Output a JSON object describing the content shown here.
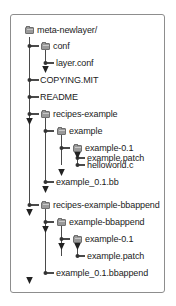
{
  "diagram": {
    "border_color": "#8d8d8d",
    "line_color": "#4a4a4a",
    "folder_color": "#9a9a9a",
    "text_color": "#1b1b1b",
    "nodes": [
      {
        "label": "meta-newlayer/",
        "type": "folder",
        "depth": 0
      },
      {
        "label": "conf",
        "type": "folder",
        "depth": 1
      },
      {
        "label": "layer.conf",
        "type": "file",
        "depth": 2
      },
      {
        "label": "COPYING.MIT",
        "type": "file",
        "depth": 1
      },
      {
        "label": "README",
        "type": "file",
        "depth": 1
      },
      {
        "label": "recipes-example",
        "type": "folder",
        "depth": 1
      },
      {
        "label": "example",
        "type": "folder",
        "depth": 2
      },
      {
        "label": "example-0.1",
        "type": "folder",
        "depth": 3
      },
      {
        "label": "example.patch",
        "type": "file",
        "depth": 4
      },
      {
        "label": "helloworld.c",
        "type": "file",
        "depth": 4
      },
      {
        "label": "example_0.1.bb",
        "type": "file",
        "depth": 3
      },
      {
        "label": "recipes-example-bbappend",
        "type": "folder",
        "depth": 1
      },
      {
        "label": "example-bbappend",
        "type": "folder",
        "depth": 2
      },
      {
        "label": "example-0.1",
        "type": "folder",
        "depth": 3
      },
      {
        "label": "example.patch",
        "type": "file",
        "depth": 4
      },
      {
        "label": "example_0.1.bbappend",
        "type": "file",
        "depth": 3
      }
    ]
  }
}
